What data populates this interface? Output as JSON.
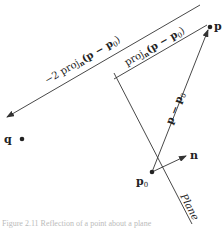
{
  "diagram": {
    "labels": {
      "p": "p",
      "p0_base": "p",
      "p0_sub": "0",
      "q": "q",
      "n": "n",
      "plane": "Plane",
      "vec_base": "p − p",
      "vec_sub": "0",
      "proj_prefix": "proj",
      "proj_sub": "n",
      "proj_arg": "(p − p",
      "proj_arg_sub": "0",
      "proj_close": ")",
      "neg2_prefix": "−2 proj",
      "neg2_sub": "n",
      "neg2_arg": "(p − p",
      "neg2_arg_sub": "0",
      "neg2_close": ")"
    },
    "points": {
      "p": [
        210,
        27
      ],
      "p0": [
        152,
        172
      ],
      "q": [
        13,
        140
      ],
      "n_tip": [
        186,
        156
      ]
    },
    "colors": {
      "line": "#333333",
      "text": "#222222"
    }
  },
  "caption": "Figure 2.11  Reflection of a point about a plane"
}
